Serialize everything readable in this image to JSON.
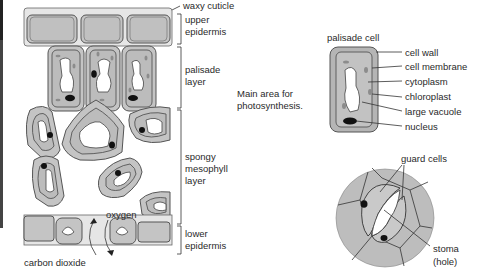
{
  "diagram": {
    "colors": {
      "cell_fill": "#bdbdbd",
      "cytoplasm": "#c9c9c9",
      "outline": "#555555",
      "vacuole": "#ffffff",
      "nucleus": "#111111",
      "chloroplast": "#8a8a8a"
    },
    "leaf_labels": {
      "waxy_cuticle": "waxy cuticle",
      "upper_epidermis_1": "upper",
      "upper_epidermis_2": "epidermis",
      "palisade_1": "palisade",
      "palisade_2": "layer",
      "spongy_1": "spongy",
      "spongy_2": "mesophyll",
      "spongy_3": "layer",
      "lower_1": "lower",
      "lower_2": "epidermis",
      "oxygen": "oxygen",
      "carbon_dioxide": "carbon dioxide"
    },
    "note": {
      "line1": "Main area for",
      "line2": "photosynthesis."
    },
    "palisade_cell": {
      "title": "palisade cell",
      "parts": [
        "cell wall",
        "cell membrane",
        "cytoplasm",
        "chloroplast",
        "large vacuole",
        "nucleus"
      ]
    },
    "stoma": {
      "guard_cells": "guard cells",
      "stoma_1": "stoma",
      "stoma_2": "(hole)"
    }
  }
}
